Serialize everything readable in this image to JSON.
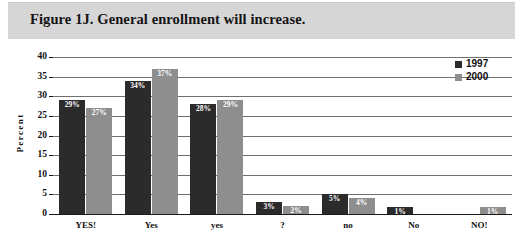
{
  "figure": {
    "title": "Figure 1J. General enrollment will increase."
  },
  "chart_data": {
    "type": "bar",
    "title": "Figure 1J. General enrollment will increase.",
    "xlabel": "",
    "ylabel": "Percent",
    "ylim": [
      0,
      40
    ],
    "yticks": [
      "0",
      "5",
      "10",
      "15",
      "20",
      "25",
      "30",
      "35",
      "40"
    ],
    "grid": true,
    "legend_position": "top-right",
    "categories": [
      "YES!",
      "Yes",
      "yes",
      "?",
      "no",
      "No",
      "NO!"
    ],
    "series": [
      {
        "name": "1997",
        "color": "#2b2b2b",
        "values": [
          29,
          34,
          28,
          3,
          5,
          1,
          null
        ],
        "labels": [
          "29%",
          "34%",
          "28%",
          "3%",
          "5%",
          "1%",
          ""
        ]
      },
      {
        "name": "2000",
        "color": "#8e8e8e",
        "values": [
          27,
          37,
          29,
          2,
          4,
          null,
          1
        ],
        "labels": [
          "27%",
          "37%",
          "29%",
          "2%",
          "4%",
          "",
          "1%"
        ]
      }
    ]
  },
  "legend": {
    "items": [
      {
        "label": "1997",
        "color": "#2b2b2b"
      },
      {
        "label": "2000",
        "color": "#8e8e8e"
      }
    ]
  },
  "axis": {
    "y_title": "Percent"
  }
}
